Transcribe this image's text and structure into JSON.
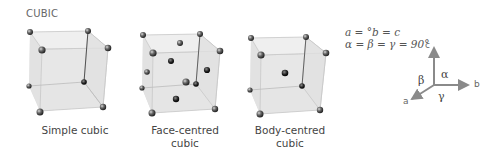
{
  "title": "CUBIC",
  "structures": [
    {
      "name": "simple-cubic",
      "label": "Simple cubic"
    },
    {
      "name": "face-centred-cubic",
      "label_line1": "Face-centred",
      "label_line2": "cubic"
    },
    {
      "name": "body-centred-cubic",
      "label_line1": "Body-centred",
      "label_line2": "cubic"
    }
  ],
  "equations": {
    "lengths": "a = °b = c",
    "angles": "α = β = γ = 90°"
  },
  "axes": {
    "a": "a",
    "b": "b",
    "c": "c",
    "alpha": "α",
    "beta": "β",
    "gamma": "γ"
  },
  "colors": {
    "cube_face": "#e4e4e4",
    "cube_edge": "#bdbdbd",
    "atom": "#3a3a3a",
    "axis": "#8a8a8a"
  }
}
